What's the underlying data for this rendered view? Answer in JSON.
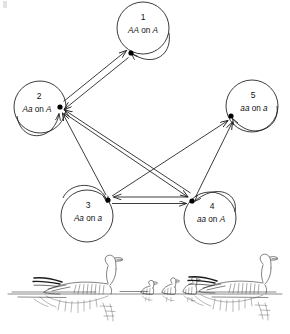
{
  "figure": {
    "nodes": [
      {
        "id": "1",
        "number": "1",
        "genotype_italic_a": "AA",
        "on_word": " on ",
        "genotype_italic_b": "A",
        "full_label": "AA on A",
        "cx": 143,
        "cy": 28,
        "r": 26,
        "dot_x": 131,
        "dot_y": 53
      },
      {
        "id": "2",
        "number": "2",
        "genotype_italic_a": "Aa",
        "on_word": " on ",
        "genotype_italic_b": "A",
        "full_label": "Aa on A",
        "cx": 40,
        "cy": 107,
        "r": 26,
        "dot_x": 60,
        "dot_y": 107
      },
      {
        "id": "3",
        "number": "3",
        "genotype_italic_a": "Aa",
        "on_word": " on ",
        "genotype_italic_b": "a",
        "full_label": "Aa on a",
        "cx": 87,
        "cy": 216,
        "r": 26,
        "dot_x": 108,
        "dot_y": 200
      },
      {
        "id": "4",
        "number": "4",
        "genotype_italic_a": "aa",
        "on_word": " on ",
        "genotype_italic_b": "A",
        "full_label": "aa on A",
        "cx": 210,
        "cy": 218,
        "r": 26,
        "dot_x": 192,
        "dot_y": 201
      },
      {
        "id": "5",
        "number": "5",
        "genotype_italic_a": "aa",
        "on_word": " on ",
        "genotype_italic_b": "a",
        "full_label": "aa on a",
        "cx": 252,
        "cy": 106,
        "r": 26,
        "dot_x": 231,
        "dot_y": 116
      }
    ],
    "edges": [
      {
        "from": "1",
        "to": "2",
        "kind": "bidirectional"
      },
      {
        "from": "3",
        "to": "4",
        "kind": "bidirectional"
      },
      {
        "from": "2",
        "to": "4",
        "kind": "bidirectional"
      },
      {
        "from": "3",
        "to": "2",
        "kind": "directed"
      },
      {
        "from": "3",
        "to": "5",
        "kind": "directed"
      },
      {
        "from": "4",
        "to": "5",
        "kind": "directed"
      },
      {
        "from": "1",
        "to": "1",
        "kind": "self-loop"
      },
      {
        "from": "2",
        "to": "2",
        "kind": "self-loop"
      },
      {
        "from": "3",
        "to": "3",
        "kind": "self-loop"
      },
      {
        "from": "4",
        "to": "4",
        "kind": "self-loop"
      },
      {
        "from": "5",
        "to": "5",
        "kind": "self-loop"
      }
    ],
    "illustration": {
      "name": "geese-with-goslings",
      "description": "Two adult snow geese swimming on water with three goslings between them, reflections below"
    },
    "colors": {
      "stroke": "#1a1a1a",
      "background": "#ffffff",
      "dot": "#000000",
      "illustration_stroke": "#2b2b2b"
    }
  }
}
